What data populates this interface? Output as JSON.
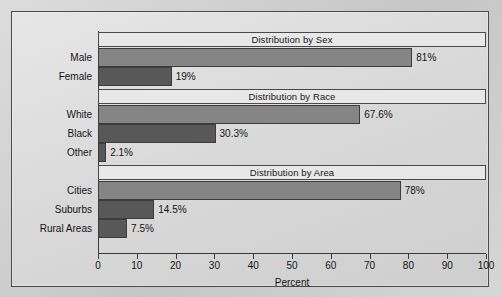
{
  "chart_data": {
    "type": "bar",
    "orientation": "horizontal",
    "title": "",
    "xlabel": "Percent",
    "ylabel": "",
    "xlim": [
      0,
      100
    ],
    "xticks": [
      0,
      10,
      20,
      30,
      40,
      50,
      60,
      70,
      80,
      90,
      100
    ],
    "xtick_labels": [
      "0",
      "10",
      "20",
      "30",
      "40",
      "50",
      "60",
      "70",
      "80",
      "90",
      "100"
    ],
    "grid": false,
    "legend": "none",
    "categories": [
      "Male",
      "Female",
      "White",
      "Black",
      "Other",
      "Cities",
      "Suburbs",
      "Rural Areas"
    ],
    "values": [
      81,
      19,
      67.6,
      30.3,
      2.1,
      78,
      14.5,
      7.5
    ],
    "value_labels": [
      "81%",
      "19%",
      "67.6%",
      "30.3%",
      "2.1%",
      "78%",
      "14.5%",
      "7.5%"
    ],
    "sections": [
      {
        "header": "Distribution by Sex",
        "bars": [
          {
            "label": "Male",
            "value": 81,
            "value_label": "81%",
            "tone": "tone-a"
          },
          {
            "label": "Female",
            "value": 19,
            "value_label": "19%",
            "tone": "tone-b"
          }
        ]
      },
      {
        "header": "Distribution by Race",
        "bars": [
          {
            "label": "White",
            "value": 67.6,
            "value_label": "67.6%",
            "tone": "tone-a"
          },
          {
            "label": "Black",
            "value": 30.3,
            "value_label": "30.3%",
            "tone": "tone-b"
          },
          {
            "label": "Other",
            "value": 2.1,
            "value_label": "2.1%",
            "tone": "tone-b"
          }
        ]
      },
      {
        "header": "Distribution by Area",
        "bars": [
          {
            "label": "Cities",
            "value": 78,
            "value_label": "78%",
            "tone": "tone-a"
          },
          {
            "label": "Suburbs",
            "value": 14.5,
            "value_label": "14.5%",
            "tone": "tone-b"
          },
          {
            "label": "Rural Areas",
            "value": 7.5,
            "value_label": "7.5%",
            "tone": "tone-b"
          }
        ]
      }
    ],
    "colors": {
      "bar_light": "#858585",
      "bar_dark": "#585858",
      "header_band": "#e8e8e8",
      "frame": "#4a4a4a",
      "background": "#d5d5d5",
      "text": "#141414"
    }
  }
}
